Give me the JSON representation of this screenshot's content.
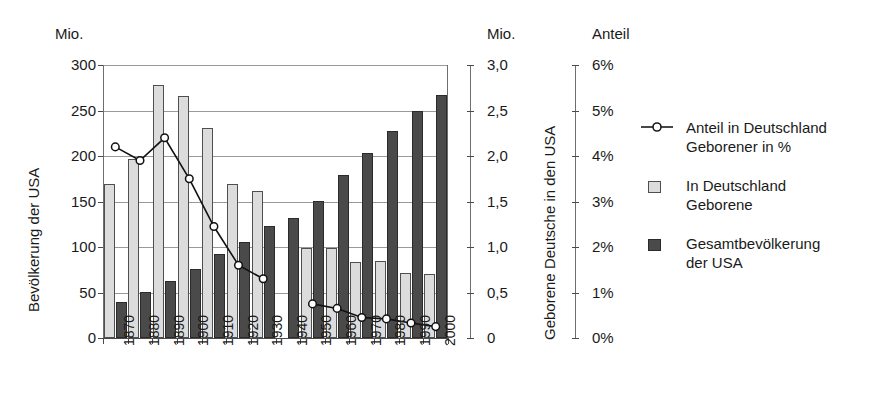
{
  "chart_data": {
    "type": "bar",
    "title": "",
    "categories": [
      "1870",
      "1880",
      "1890",
      "1900",
      "1910",
      "1920",
      "1930",
      "1940",
      "1950",
      "1960",
      "1970",
      "1980",
      "1990",
      "2000"
    ],
    "xlabel": "",
    "axes": {
      "left": {
        "unit_label": "Mio.",
        "title": "Bevölkerung der USA",
        "ticks": [
          "0",
          "50",
          "100",
          "150",
          "200",
          "250",
          "300"
        ],
        "min": 0,
        "max": 300,
        "step": 50
      },
      "right_primary": {
        "unit_label": "Mio.",
        "title": "Geborene Deutsche in den USA",
        "ticks": [
          "0",
          "0,5",
          "1,0",
          "1,5",
          "2,0",
          "2,5",
          "3,0"
        ],
        "min": 0,
        "max": 3.0,
        "step": 0.5
      },
      "right_secondary": {
        "unit_label": "Anteil",
        "title": "",
        "ticks": [
          "0%",
          "1%",
          "2%",
          "3%",
          "4%",
          "5%",
          "6%"
        ],
        "min": 0,
        "max": 6,
        "step": 1
      }
    },
    "grid": true,
    "legend_position": "right",
    "series": [
      {
        "name": "Anteil in Deutschland Geborener in %",
        "type": "line",
        "axis": "right_secondary",
        "unit": "%",
        "marker": "open-circle",
        "values": [
          4.2,
          3.9,
          4.4,
          3.5,
          2.45,
          1.6,
          1.3,
          null,
          0.75,
          0.65,
          0.45,
          0.42,
          0.33,
          0.25
        ]
      },
      {
        "name": "In Deutschland Geborene",
        "type": "bar",
        "axis": "right_primary",
        "unit": "Mio.",
        "color": "#dcdcdc",
        "values": [
          1.69,
          1.97,
          2.78,
          2.66,
          2.31,
          1.69,
          1.61,
          null,
          0.99,
          0.99,
          0.83,
          0.85,
          0.71,
          0.7
        ]
      },
      {
        "name": "Gesamtbevölkerung der USA",
        "type": "bar",
        "axis": "left",
        "unit": "Mio.",
        "color": "#4a4a4a",
        "values": [
          40,
          50,
          63,
          76,
          92,
          106,
          123,
          132,
          151,
          179,
          203,
          227,
          249,
          267
        ]
      }
    ]
  },
  "legend": {
    "items": [
      {
        "marker": "line-open-circle",
        "label_line1": "Anteil in Deutschland",
        "label_line2": "Geborener in %"
      },
      {
        "marker": "swatch-light",
        "label_line1": "In Deutschland",
        "label_line2": "Geborene"
      },
      {
        "marker": "swatch-dark",
        "label_line1": "Gesamtbevölkerung",
        "label_line2": "der USA"
      }
    ]
  }
}
